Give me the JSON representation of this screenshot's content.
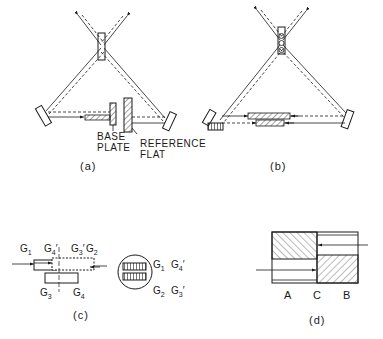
{
  "panels": {
    "a": {
      "caption": "(a)",
      "labels": {
        "base_plate_line1": "BASE",
        "base_plate_line2": "PLATE",
        "reference_flat_line1": "REFERENCE",
        "reference_flat_line2": "FLAT"
      }
    },
    "b": {
      "caption": "(b)"
    },
    "c": {
      "caption": "(c)",
      "left_labels": {
        "g1": "G",
        "g1_sub": "1",
        "g4p": "G",
        "g4p_sub": "4",
        "g4p_prime": "′",
        "g3p": "G",
        "g3p_sub": "3",
        "g3p_prime": "′",
        "g2": "G",
        "g2_sub": "2",
        "g3": "G",
        "g3_sub": "3",
        "g4": "G",
        "g4_sub": "4"
      },
      "right_labels": {
        "g1": "G",
        "g1_sub": "1",
        "g4p": "G",
        "g4p_sub": "4",
        "g4p_prime": "′",
        "g2": "G",
        "g2_sub": "2",
        "g3p": "G",
        "g3p_sub": "3",
        "g3p_prime": "′"
      }
    },
    "d": {
      "caption": "(d)",
      "labels": {
        "a": "A",
        "c": "C",
        "b": "B"
      }
    }
  },
  "colors": {
    "ink": "#1a1a1a",
    "paper": "#ffffff"
  }
}
